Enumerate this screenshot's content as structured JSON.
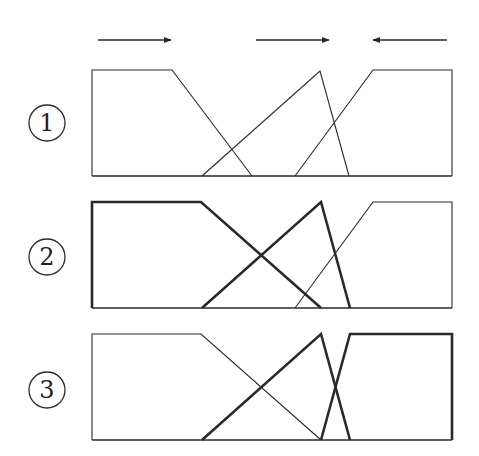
{
  "diagram": {
    "stroke_color": "#2a2a2a",
    "arrows": [
      {
        "x1": 98,
        "x2": 171,
        "y": 40,
        "direction": "right"
      },
      {
        "x1": 256,
        "x2": 329,
        "y": 40,
        "direction": "right"
      },
      {
        "x1": 447,
        "x2": 373,
        "y": 40,
        "direction": "left"
      }
    ],
    "panels": [
      {
        "label": "1",
        "circle": {
          "cx": 47,
          "cy": 123,
          "r": 18
        },
        "box": {
          "left": 92,
          "right": 452,
          "top": 70,
          "bottom": 176
        },
        "shapes": [
          {
            "name": "left-trapezoid",
            "bold": false,
            "points": [
              [
                92,
                176
              ],
              [
                92,
                70
              ],
              [
                172,
                70
              ],
              [
                252,
                176
              ]
            ]
          },
          {
            "name": "middle-triangle",
            "bold": false,
            "points": [
              [
                202,
                176
              ],
              [
                320,
                71
              ],
              [
                349,
                176
              ]
            ]
          },
          {
            "name": "right-trapezoid",
            "bold": false,
            "points": [
              [
                295,
                176
              ],
              [
                373,
                70
              ],
              [
                452,
                70
              ],
              [
                452,
                176
              ]
            ]
          }
        ]
      },
      {
        "label": "2",
        "circle": {
          "cx": 47,
          "cy": 257,
          "r": 18
        },
        "box": {
          "left": 92,
          "right": 452,
          "top": 202,
          "bottom": 308
        },
        "shapes": [
          {
            "name": "left-trapezoid",
            "bold": true,
            "points": [
              [
                92,
                308
              ],
              [
                92,
                202
              ],
              [
                201,
                202
              ],
              [
                321,
                308
              ]
            ]
          },
          {
            "name": "middle-triangle",
            "bold": true,
            "points": [
              [
                202,
                308
              ],
              [
                321,
                202
              ],
              [
                350,
                308
              ]
            ]
          },
          {
            "name": "right-trapezoid",
            "bold": false,
            "points": [
              [
                295,
                308
              ],
              [
                373,
                202
              ],
              [
                452,
                202
              ],
              [
                452,
                308
              ]
            ]
          }
        ]
      },
      {
        "label": "3",
        "circle": {
          "cx": 47,
          "cy": 390,
          "r": 18
        },
        "box": {
          "left": 92,
          "right": 452,
          "top": 334,
          "bottom": 440
        },
        "shapes": [
          {
            "name": "left-trapezoid",
            "bold": false,
            "points": [
              [
                92,
                440
              ],
              [
                92,
                334
              ],
              [
                201,
                334
              ],
              [
                321,
                440
              ]
            ]
          },
          {
            "name": "middle-triangle",
            "bold": true,
            "points": [
              [
                202,
                440
              ],
              [
                321,
                334
              ],
              [
                350,
                440
              ]
            ]
          },
          {
            "name": "right-trapezoid",
            "bold": true,
            "points": [
              [
                321,
                440
              ],
              [
                350,
                334
              ],
              [
                452,
                334
              ],
              [
                452,
                440
              ]
            ]
          }
        ]
      }
    ]
  }
}
